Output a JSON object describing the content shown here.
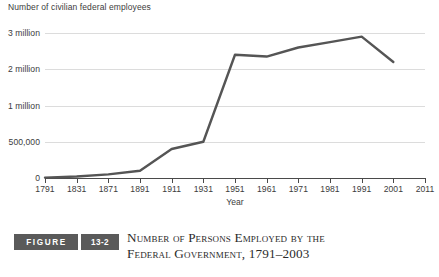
{
  "figure": {
    "word_label": "FIGURE",
    "number_label": "13-2",
    "caption_line1": "Number of Persons Employed by the",
    "caption_line2": "Federal Government, 1791–2003",
    "badge_color": "#5a5a5a"
  },
  "chart_data": {
    "type": "line",
    "title": "Number of Persons Employed by the Federal Government, 1791–2003",
    "ylabel": "Number of civilian federal employees",
    "xlabel": "Year",
    "grid": true,
    "legend": "none",
    "line_color": "#555555",
    "x_tick_labels": [
      "1791",
      "1831",
      "1871",
      "1891",
      "1911",
      "1931",
      "1951",
      "1961",
      "1971",
      "1981",
      "1991",
      "2001",
      "2011"
    ],
    "y_tick_labels": [
      "0",
      "500,000",
      "1 million",
      "2 million",
      "3 million"
    ],
    "y_tick_values": [
      0,
      500000,
      1000000,
      2000000,
      3000000
    ],
    "y_axis_note": "non-linear spacing: equal pixel steps between 0, 500,000, 1 million, 2 million, 3 million",
    "x": [
      "1791",
      "1831",
      "1871",
      "1891",
      "1911",
      "1931",
      "1951",
      "1961",
      "1971",
      "1981",
      "1991",
      "2001"
    ],
    "values": [
      5000,
      20000,
      50000,
      100000,
      400000,
      500000,
      2400000,
      2350000,
      2600000,
      2750000,
      2900000,
      2200000
    ],
    "series": [
      {
        "name": "Civilian federal employees",
        "values": [
          5000,
          20000,
          50000,
          100000,
          400000,
          500000,
          2400000,
          2350000,
          2600000,
          2750000,
          2900000,
          2200000
        ]
      }
    ],
    "annotations": []
  }
}
